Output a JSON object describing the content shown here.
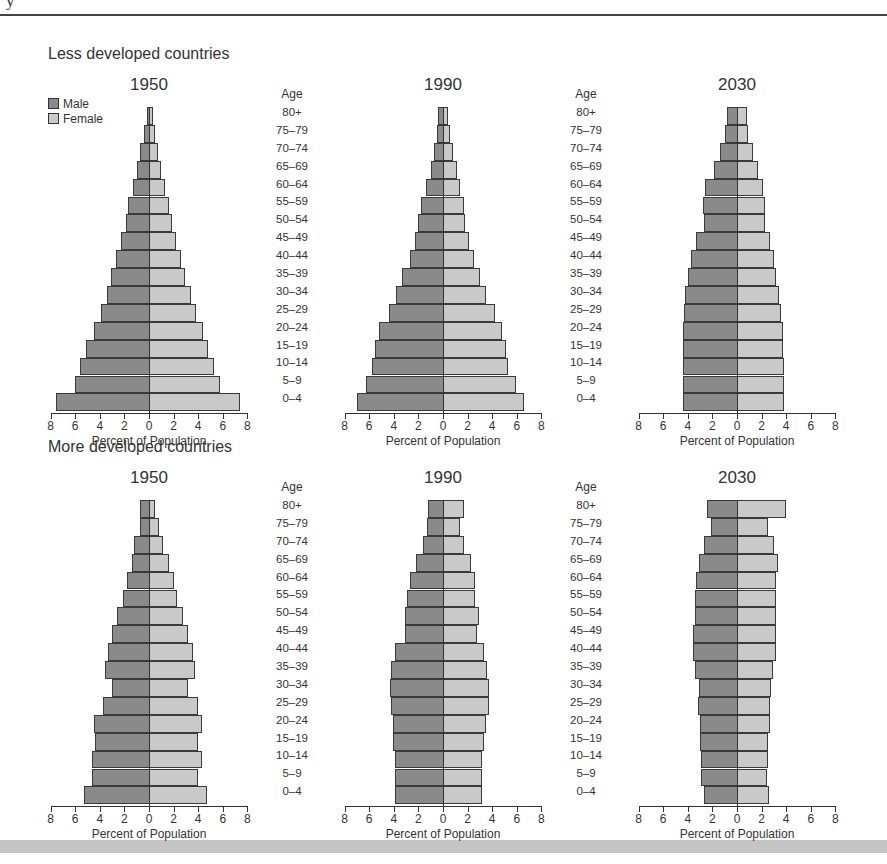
{
  "header": {
    "clipped_text": "y",
    "rule": true
  },
  "legend": {
    "male_label": "Male",
    "female_label": "Female",
    "male_color": "#8a8a8a",
    "female_color": "#c9c9c9"
  },
  "age_header": "Age",
  "age_groups": [
    "80+",
    "75–79",
    "70–74",
    "65–69",
    "60–64",
    "55–59",
    "50–54",
    "45–49",
    "40–44",
    "35–39",
    "30–34",
    "25–29",
    "20–24",
    "15–19",
    "10–14",
    "5–9",
    "0–4"
  ],
  "axis": {
    "ticks": [
      8,
      6,
      4,
      2,
      0,
      2,
      4,
      6,
      8
    ],
    "title": "Percent of Population"
  },
  "sections": [
    {
      "title": "Less developed countries"
    },
    {
      "title": "More developed countries"
    }
  ],
  "chart_data": [
    {
      "type": "bar",
      "orientation": "horizontal",
      "title": "Less developed countries — 1950",
      "xlabel": "Percent of Population",
      "ylabel": "Age",
      "xlim": [
        -8,
        8
      ],
      "categories_bottom_to_top": [
        "0–4",
        "5–9",
        "10–14",
        "15–19",
        "20–24",
        "25–29",
        "30–34",
        "35–39",
        "40–44",
        "45–49",
        "50–54",
        "55–59",
        "60–64",
        "65–69",
        "70–74",
        "75–79",
        "80+"
      ],
      "series": [
        {
          "name": "Male",
          "values": [
            7.6,
            6.0,
            5.6,
            5.1,
            4.5,
            3.9,
            3.4,
            3.1,
            2.7,
            2.3,
            1.9,
            1.7,
            1.3,
            1.0,
            0.7,
            0.4,
            0.2
          ]
        },
        {
          "name": "Female",
          "values": [
            7.4,
            5.8,
            5.3,
            4.8,
            4.4,
            3.8,
            3.4,
            2.9,
            2.6,
            2.2,
            1.9,
            1.6,
            1.3,
            1.0,
            0.7,
            0.5,
            0.3
          ]
        }
      ]
    },
    {
      "type": "bar",
      "orientation": "horizontal",
      "title": "Less developed countries — 1990",
      "xlabel": "Percent of Population",
      "ylabel": "Age",
      "xlim": [
        -8,
        8
      ],
      "categories_bottom_to_top": [
        "0–4",
        "5–9",
        "10–14",
        "15–19",
        "20–24",
        "25–29",
        "30–34",
        "35–39",
        "40–44",
        "45–49",
        "50–54",
        "55–59",
        "60–64",
        "65–69",
        "70–74",
        "75–79",
        "80+"
      ],
      "series": [
        {
          "name": "Male",
          "values": [
            7.0,
            6.3,
            5.8,
            5.5,
            5.2,
            4.4,
            3.8,
            3.3,
            2.7,
            2.3,
            2.0,
            1.8,
            1.4,
            1.0,
            0.7,
            0.5,
            0.4
          ]
        },
        {
          "name": "Female",
          "values": [
            6.6,
            5.9,
            5.3,
            5.1,
            4.8,
            4.2,
            3.5,
            3.0,
            2.5,
            2.1,
            1.8,
            1.7,
            1.4,
            1.1,
            0.8,
            0.6,
            0.4
          ]
        }
      ]
    },
    {
      "type": "bar",
      "orientation": "horizontal",
      "title": "Less developed countries — 2030",
      "xlabel": "Percent of Population",
      "ylabel": "Age",
      "xlim": [
        -8,
        8
      ],
      "categories_bottom_to_top": [
        "0–4",
        "5–9",
        "10–14",
        "15–19",
        "20–24",
        "25–29",
        "30–34",
        "35–39",
        "40–44",
        "45–49",
        "50–54",
        "55–59",
        "60–64",
        "65–69",
        "70–74",
        "75–79",
        "80+"
      ],
      "series": [
        {
          "name": "Male",
          "values": [
            4.4,
            4.4,
            4.4,
            4.4,
            4.4,
            4.3,
            4.2,
            4.0,
            3.7,
            3.3,
            2.7,
            2.8,
            2.6,
            1.9,
            1.4,
            1.0,
            0.8
          ]
        },
        {
          "name": "Female",
          "values": [
            3.8,
            3.8,
            3.8,
            3.7,
            3.7,
            3.6,
            3.4,
            3.2,
            3.0,
            2.7,
            2.3,
            2.3,
            2.1,
            1.7,
            1.3,
            0.9,
            0.8
          ]
        }
      ]
    },
    {
      "type": "bar",
      "orientation": "horizontal",
      "title": "More developed countries — 1950",
      "xlabel": "Percent of Population",
      "ylabel": "Age",
      "xlim": [
        -8,
        8
      ],
      "categories_bottom_to_top": [
        "0–4",
        "5–9",
        "10–14",
        "15–19",
        "20–24",
        "25–29",
        "30–34",
        "35–39",
        "40–44",
        "45–49",
        "50–54",
        "55–59",
        "60–64",
        "65–69",
        "70–74",
        "75–79",
        "80+"
      ],
      "series": [
        {
          "name": "Male",
          "values": [
            5.3,
            4.6,
            4.6,
            4.4,
            4.5,
            3.7,
            3.0,
            3.6,
            3.3,
            3.0,
            2.6,
            2.1,
            1.8,
            1.4,
            1.2,
            0.7,
            0.7
          ]
        },
        {
          "name": "Female",
          "values": [
            4.7,
            4.0,
            4.3,
            4.0,
            4.3,
            4.0,
            3.2,
            3.7,
            3.6,
            3.2,
            2.8,
            2.3,
            2.0,
            1.6,
            1.1,
            0.8,
            0.5
          ]
        }
      ]
    },
    {
      "type": "bar",
      "orientation": "horizontal",
      "title": "More developed countries — 1990",
      "xlabel": "Percent of Population",
      "ylabel": "Age",
      "xlim": [
        -8,
        8
      ],
      "categories_bottom_to_top": [
        "0–4",
        "5–9",
        "10–14",
        "15–19",
        "20–24",
        "25–29",
        "30–34",
        "35–39",
        "40–44",
        "45–49",
        "50–54",
        "55–59",
        "60–64",
        "65–69",
        "70–74",
        "75–79",
        "80+"
      ],
      "series": [
        {
          "name": "Male",
          "values": [
            3.9,
            3.9,
            3.9,
            4.1,
            4.1,
            4.2,
            4.3,
            4.2,
            3.9,
            3.1,
            3.1,
            2.9,
            2.7,
            2.2,
            1.6,
            1.3,
            1.2
          ]
        },
        {
          "name": "Female",
          "values": [
            3.2,
            3.2,
            3.2,
            3.3,
            3.5,
            3.7,
            3.7,
            3.6,
            3.3,
            2.8,
            2.9,
            2.6,
            2.6,
            2.3,
            1.7,
            1.4,
            1.7
          ]
        }
      ]
    },
    {
      "type": "bar",
      "orientation": "horizontal",
      "title": "More developed countries — 2030",
      "xlabel": "Percent of Population",
      "ylabel": "Age",
      "xlim": [
        -8,
        8
      ],
      "categories_bottom_to_top": [
        "0–4",
        "5–9",
        "10–14",
        "15–19",
        "20–24",
        "25–29",
        "30–34",
        "35–39",
        "40–44",
        "45–49",
        "50–54",
        "55–59",
        "60–64",
        "65–69",
        "70–74",
        "75–79",
        "80+"
      ],
      "series": [
        {
          "name": "Male",
          "values": [
            2.7,
            2.9,
            2.9,
            3.0,
            3.0,
            3.2,
            3.1,
            3.4,
            3.6,
            3.6,
            3.4,
            3.4,
            3.3,
            3.1,
            2.7,
            2.1,
            2.4
          ]
        },
        {
          "name": "Female",
          "values": [
            2.6,
            2.4,
            2.5,
            2.5,
            2.7,
            2.7,
            2.8,
            2.9,
            3.2,
            3.2,
            3.2,
            3.2,
            3.2,
            3.3,
            3.0,
            2.5,
            4.0
          ]
        }
      ]
    }
  ],
  "panels": [
    {
      "year": "1950"
    },
    {
      "year": "1990"
    },
    {
      "year": "2030"
    },
    {
      "year": "1950"
    },
    {
      "year": "1990"
    },
    {
      "year": "2030"
    }
  ]
}
